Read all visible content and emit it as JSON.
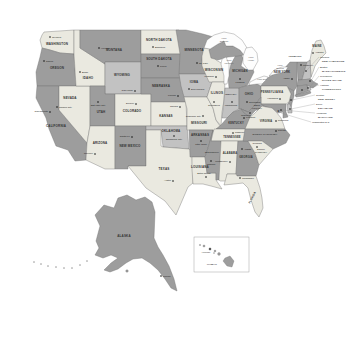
{
  "colors": {
    "light": "#eae9e0",
    "medium": "#c2c2c2",
    "dark": "#9d9d9d",
    "water": "#fdfdfd",
    "border": "#6e6e6e",
    "state_label": "#333333",
    "capital_label": "#1a1a1a",
    "lake_label": "#666666"
  },
  "dc": {
    "label": "Washington D.C."
  },
  "lakes": [
    "Lake Superior",
    "Lake Michigan",
    "Lake Huron",
    "Lake Erie",
    "Lake Ontario"
  ],
  "states": [
    {
      "id": "wa",
      "name": "Washington",
      "capital": "Olympia",
      "shade": "light"
    },
    {
      "id": "or",
      "name": "Oregon",
      "capital": "Salem",
      "shade": "dark"
    },
    {
      "id": "ca",
      "name": "California",
      "capital": "Sacramento",
      "shade": "dark"
    },
    {
      "id": "nv",
      "name": "Nevada",
      "capital": "Carson City",
      "shade": "light"
    },
    {
      "id": "id",
      "name": "Idaho",
      "capital": "Boise",
      "shade": "light"
    },
    {
      "id": "mt",
      "name": "Montana",
      "capital": "Helena",
      "shade": "dark"
    },
    {
      "id": "wy",
      "name": "Wyoming",
      "capital": "Cheyenne",
      "shade": "medium"
    },
    {
      "id": "ut",
      "name": "Utah",
      "capital": "Salt Lake City",
      "shade": "dark"
    },
    {
      "id": "co",
      "name": "Colorado",
      "capital": "Denver",
      "shade": "light"
    },
    {
      "id": "az",
      "name": "Arizona",
      "capital": "Phoenix",
      "shade": "light"
    },
    {
      "id": "nm",
      "name": "New Mexico",
      "capital": "Santa Fe",
      "shade": "dark"
    },
    {
      "id": "nd",
      "name": "North Dakota",
      "capital": "Bismarck",
      "shade": "light"
    },
    {
      "id": "sd",
      "name": "South Dakota",
      "capital": "Pierre",
      "shade": "dark"
    },
    {
      "id": "ne",
      "name": "Nebraska",
      "capital": "Lincoln",
      "shade": "dark"
    },
    {
      "id": "ks",
      "name": "Kansas",
      "capital": "Topeka",
      "shade": "light"
    },
    {
      "id": "ok",
      "name": "Oklahoma",
      "capital": "Oklahoma City",
      "shade": "medium"
    },
    {
      "id": "tx",
      "name": "Texas",
      "capital": "Austin",
      "shade": "light"
    },
    {
      "id": "mn",
      "name": "Minnesota",
      "capital": "St. Paul",
      "shade": "dark"
    },
    {
      "id": "ia",
      "name": "Iowa",
      "capital": "Des Moines",
      "shade": "medium"
    },
    {
      "id": "mo",
      "name": "Missouri",
      "capital": "Jefferson City",
      "shade": "light"
    },
    {
      "id": "ar",
      "name": "Arkansas",
      "capital": "Little Rock",
      "shade": "dark"
    },
    {
      "id": "la",
      "name": "Louisiana",
      "capital": "Baton Rouge",
      "shade": "light"
    },
    {
      "id": "wi",
      "name": "Wisconsin",
      "capital": "Madison",
      "shade": "light"
    },
    {
      "id": "il",
      "name": "Illinois",
      "capital": "Springfield",
      "shade": "light"
    },
    {
      "id": "in",
      "name": "Indiana",
      "capital": "Indianapolis",
      "shade": "medium"
    },
    {
      "id": "mi",
      "name": "Michigan",
      "capital": "Lansing",
      "shade": "dark"
    },
    {
      "id": "oh",
      "name": "Ohio",
      "capital": "Columbus",
      "shade": "dark"
    },
    {
      "id": "ky",
      "name": "Kentucky",
      "capital": "Frankfort",
      "shade": "dark"
    },
    {
      "id": "tn",
      "name": "Tennessee",
      "capital": "Nashville",
      "shade": "light"
    },
    {
      "id": "ms",
      "name": "Mississippi",
      "capital": "Jackson",
      "shade": "dark"
    },
    {
      "id": "al",
      "name": "Alabama",
      "capital": "Montgomery",
      "shade": "light"
    },
    {
      "id": "ga",
      "name": "Georgia",
      "capital": "Atlanta",
      "shade": "dark"
    },
    {
      "id": "fl",
      "name": "Florida",
      "capital": "Tallahassee",
      "shade": "light"
    },
    {
      "id": "me",
      "name": "Maine",
      "capital": "Augusta",
      "shade": "light"
    },
    {
      "id": "vt",
      "name": "Vermont",
      "capital": "Montpelier",
      "shade": "dark"
    },
    {
      "id": "nh",
      "name": "New Hampshire",
      "capital": "Concord",
      "shade": "medium"
    },
    {
      "id": "ma",
      "name": "Massachusetts",
      "capital": "Boston",
      "shade": "dark"
    },
    {
      "id": "ri",
      "name": "Rhode Island",
      "capital": "Providence",
      "shade": "medium"
    },
    {
      "id": "ct",
      "name": "Connecticut",
      "capital": "Hartford",
      "shade": "dark"
    },
    {
      "id": "ny",
      "name": "New York",
      "capital": "Albany",
      "shade": "dark"
    },
    {
      "id": "nj",
      "name": "New Jersey",
      "capital": "Trenton",
      "shade": "dark"
    },
    {
      "id": "pa",
      "name": "Pennsylvania",
      "capital": "Harrisburg",
      "shade": "light"
    },
    {
      "id": "de",
      "name": "Delaware",
      "capital": "Dover",
      "shade": "medium"
    },
    {
      "id": "md",
      "name": "Maryland",
      "capital": "Annapolis",
      "shade": "dark"
    },
    {
      "id": "wv",
      "name": "West Virginia",
      "capital": "Charleston",
      "shade": "dark"
    },
    {
      "id": "va",
      "name": "Virginia",
      "capital": "Richmond",
      "shade": "light"
    },
    {
      "id": "nc",
      "name": "North Carolina",
      "capital": "Raleigh",
      "shade": "dark"
    },
    {
      "id": "sc",
      "name": "South Carolina",
      "capital": "Columbia",
      "shade": "light"
    },
    {
      "id": "ak",
      "name": "Alaska",
      "capital": "Juneau",
      "shade": "dark"
    },
    {
      "id": "hi",
      "name": "Hawaii",
      "capital": "Honolulu",
      "shade": "dark"
    }
  ]
}
